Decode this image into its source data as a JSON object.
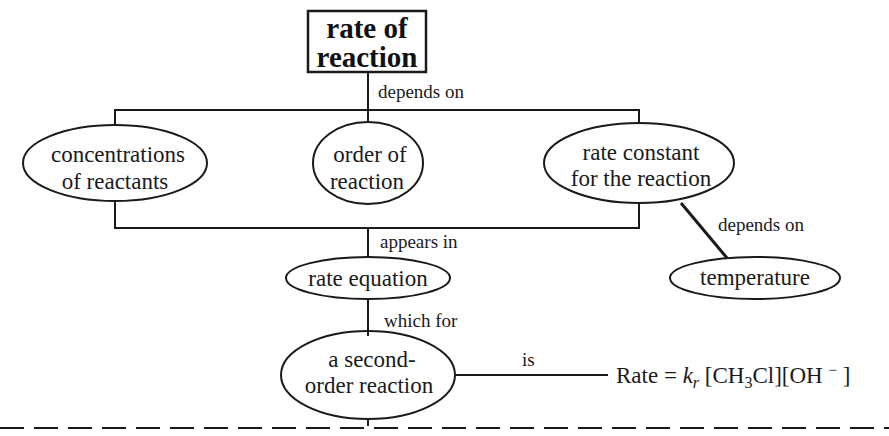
{
  "diagram": {
    "type": "concept-map",
    "title": {
      "line1": "rate of",
      "line2": "reaction"
    },
    "links": {
      "title_to_factors": "depends on",
      "factors_to_equation": "appears in",
      "constant_to_temperature": "depends on",
      "equation_to_second_order": "which for",
      "second_order_to_expression": "is"
    },
    "nodes": {
      "concentrations": {
        "line1": "concentrations",
        "line2": "of reactants"
      },
      "order": {
        "line1": "order of",
        "line2": "reaction"
      },
      "rate_constant": {
        "line1": "rate constant",
        "line2": "for the reaction"
      },
      "temperature": {
        "label": "temperature"
      },
      "rate_equation": {
        "label": "rate equation"
      },
      "second_order": {
        "line1": "a second-",
        "line2": "order reaction"
      }
    },
    "expression": {
      "prefix": "Rate = ",
      "k": "k",
      "k_sub": "r",
      "conc1_open": " [CH",
      "conc1_sub": "3",
      "conc1_close": "Cl][OH ",
      "charge": "−",
      "end": " ]"
    },
    "colors": {
      "ink": "#1a1a1a",
      "background": "#ffffff"
    }
  }
}
